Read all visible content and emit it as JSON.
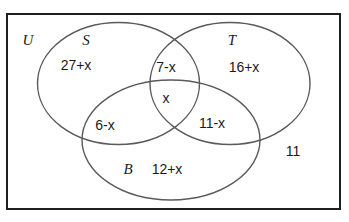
{
  "diagram": {
    "universe": {
      "label": "U",
      "outside_value": "11"
    },
    "sets": [
      {
        "key": "S",
        "label": "S",
        "only_value": "27+x"
      },
      {
        "key": "T",
        "label": "T",
        "only_value": "16+x"
      },
      {
        "key": "B",
        "label": "B",
        "only_value": "12+x"
      }
    ],
    "regions": {
      "s_only": "27+x",
      "t_only": "16+x",
      "b_only": "12+x",
      "s_and_t_only": "7-x",
      "s_and_b_only": "6-x",
      "t_and_b_only": "11-x",
      "all_three": "x",
      "outside_all": "11"
    },
    "colors": {
      "background": "#ffffff",
      "universe_border": "#1f1f1f",
      "ellipse_stroke": "#5a5a5a",
      "text": "#1a1a1a"
    }
  }
}
